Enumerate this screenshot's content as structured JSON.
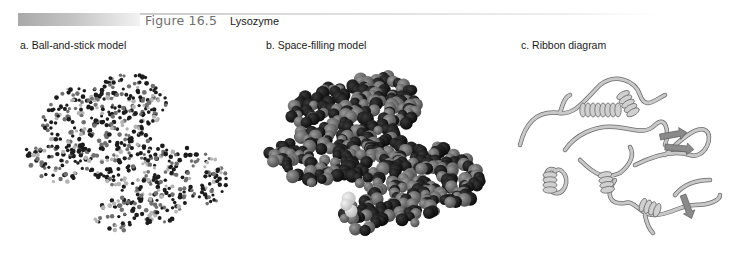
{
  "figure": {
    "number": "Figure 16.5",
    "title": "Lysozyme"
  },
  "panels": [
    {
      "id": "a",
      "label": "a. Ball-and-stick model",
      "kind": "ball-and-stick"
    },
    {
      "id": "b",
      "label": "b. Space-filling model",
      "kind": "space-filling"
    },
    {
      "id": "c",
      "label": "c. Ribbon diagram",
      "kind": "ribbon"
    }
  ],
  "colors": {
    "header_bar": "#a9a9a9",
    "figure_number": "#6e6e6e",
    "text": "#1a1a1a",
    "atom_dark": "#1c1c1c",
    "atom_mid": "#6f6f6f",
    "atom_light": "#b5b5b5",
    "ribbon": "#c8c8c8",
    "ribbon_shadow": "#6a6a6a"
  }
}
